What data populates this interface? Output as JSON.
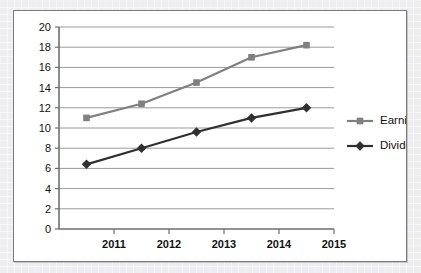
{
  "chart_data": {
    "type": "line",
    "title": "",
    "xlabel": "",
    "ylabel": "",
    "categories": [
      "2011",
      "2012",
      "2013",
      "2014",
      "2015"
    ],
    "x_tick_labels": [
      "2011",
      "2012",
      "2013",
      "2014",
      "2015"
    ],
    "y_tick_labels": [
      "0",
      "2",
      "4",
      "6",
      "8",
      "10",
      "12",
      "14",
      "16",
      "18",
      "20"
    ],
    "y_ticks": [
      0,
      2,
      4,
      6,
      8,
      10,
      12,
      14,
      16,
      18,
      20
    ],
    "ylim": [
      0,
      20
    ],
    "grid": "horizontal",
    "legend_position": "right",
    "series": [
      {
        "name": "Earning per share",
        "marker": "square",
        "color": "#808080",
        "values": [
          11.0,
          12.4,
          14.5,
          17.0,
          18.2
        ]
      },
      {
        "name": "Dividend per share",
        "marker": "diamond",
        "color": "#303030",
        "values": [
          6.4,
          8.0,
          9.6,
          11.0,
          12.0
        ]
      }
    ]
  },
  "legend": {
    "items": [
      {
        "label": "Earning per share",
        "color": "#808080",
        "marker": "square"
      },
      {
        "label": "Dividend per share",
        "color": "#303030",
        "marker": "diamond"
      }
    ]
  },
  "colors": {
    "series_earning": "#808080",
    "series_dividend": "#303030",
    "gridline": "#9a9a9a",
    "axis": "#6e6e6e",
    "panel_border": "#7a7a7a",
    "panel_background": "#ffffff",
    "page_background": "#eeeef0",
    "text": "#111111"
  }
}
